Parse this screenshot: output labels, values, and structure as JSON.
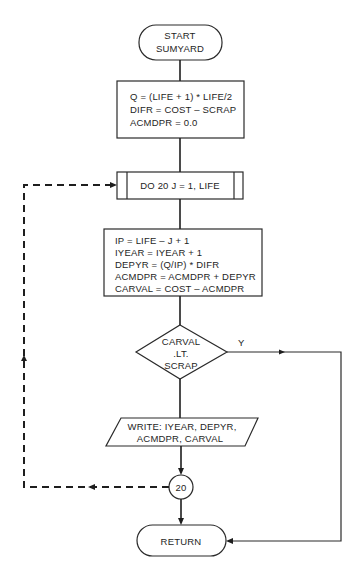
{
  "diagram": {
    "type": "flowchart",
    "start": {
      "line1": "START",
      "line2": "SUMYARD"
    },
    "init_block": {
      "lines": [
        "Q = (LIFE + 1) * LIFE/2",
        "DIFR = COST – SCRAP",
        "ACMDPR = 0.0"
      ]
    },
    "loop": {
      "label": "DO 20 J = 1, LIFE"
    },
    "compute_block": {
      "lines": [
        "IP = LIFE – J + 1",
        "IYEAR = IYEAR + 1",
        "DEPYR = (Q/IP) * DIFR",
        "ACMDPR = ACMDPR + DEPYR",
        "CARVAL = COST – ACMDPR"
      ]
    },
    "decision": {
      "lines": [
        "CARVAL",
        ".LT.",
        "SCRAP"
      ],
      "yes_label": "Y"
    },
    "output": {
      "lines": [
        "WRITE: IYEAR, DEPYR,",
        "ACMDPR, CARVAL"
      ]
    },
    "connector": {
      "label": "20"
    },
    "end": {
      "label": "RETURN"
    },
    "colors": {
      "ink": "#1e1e1e",
      "background": "#ffffff"
    }
  }
}
